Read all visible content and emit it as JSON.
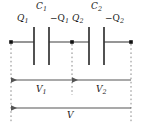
{
  "diagram": {
    "colors": {
      "wire": "#3f3f3f",
      "plate": "#333333",
      "node": "#111111",
      "arrow": "#555555",
      "dotted": "#8a8a8a",
      "text": "#1a1a1a",
      "background": "#ffffff"
    },
    "labels": {
      "charge_left_1": "Q",
      "charge_left_1_sub": "1",
      "cap_1": "C",
      "cap_1_sub": "1",
      "charge_right_1": "−Q",
      "charge_right_1_sub": "1",
      "charge_left_2": "Q",
      "charge_left_2_sub": "2",
      "cap_2": "C",
      "cap_2_sub": "2",
      "charge_right_2": "−Q",
      "charge_right_2_sub": "2",
      "voltage_1": "V",
      "voltage_1_sub": "1",
      "voltage_2": "V",
      "voltage_2_sub": "2",
      "voltage_total": "V",
      "voltage_total_sub": ""
    },
    "geometry": {
      "wire_y": 42,
      "node_left_x": 11,
      "node_mid_x": 72,
      "node_right_x": 131,
      "plate_top": 27,
      "plate_bottom": 65,
      "c1_plate_a_x": 34,
      "c1_plate_b_x": 49,
      "c2_plate_a_x": 89,
      "c2_plate_b_x": 104,
      "arrow_row_1_y": 80,
      "arrow_row_2_y": 108,
      "dotted_bottom_y": 122
    }
  }
}
